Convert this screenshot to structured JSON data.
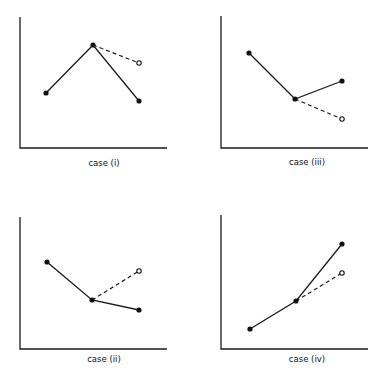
{
  "chart_data": [
    {
      "type": "line",
      "caption": "case (i)",
      "frame": {
        "x0": 20,
        "y0": 17,
        "x1": 167,
        "y1": 148
      },
      "solid_points": [
        [
          46,
          93
        ],
        [
          93,
          45
        ],
        [
          139,
          101
        ]
      ],
      "dashed": {
        "from": [
          93,
          45
        ],
        "to": [
          139,
          63
        ]
      },
      "open_point": [
        139,
        63
      ],
      "caption_pos": [
        104,
        158
      ],
      "description": "rise then fall; dashed extrapolation stays higher"
    },
    {
      "type": "line",
      "caption": "case (iii)",
      "frame": {
        "x0": 221,
        "y0": 16,
        "x1": 368,
        "y1": 148
      },
      "solid_points": [
        [
          249,
          53
        ],
        [
          295,
          99
        ],
        [
          342,
          81
        ]
      ],
      "dashed": {
        "from": [
          295,
          99
        ],
        "to": [
          342,
          119
        ]
      },
      "open_point": [
        342,
        119
      ],
      "caption_pos": [
        307,
        157
      ],
      "description": "fall then rise; dashed extrapolation continues falling"
    },
    {
      "type": "line",
      "caption": "case (ii)",
      "frame": {
        "x0": 20,
        "y0": 217,
        "x1": 167,
        "y1": 349
      },
      "solid_points": [
        [
          47,
          262
        ],
        [
          92,
          300
        ],
        [
          139,
          310
        ]
      ],
      "dashed": {
        "from": [
          92,
          300
        ],
        "to": [
          139,
          271
        ]
      },
      "open_point": [
        139,
        271
      ],
      "caption_pos": [
        104,
        354
      ],
      "description": "fall then slight fall; dashed extrapolation rises"
    },
    {
      "type": "line",
      "caption": "case (iv)",
      "frame": {
        "x0": 221,
        "y0": 215,
        "x1": 368,
        "y1": 349
      },
      "solid_points": [
        [
          250,
          329
        ],
        [
          296,
          301
        ],
        [
          342,
          244
        ]
      ],
      "dashed": {
        "from": [
          296,
          301
        ],
        "to": [
          342,
          273
        ]
      },
      "open_point": [
        342,
        273
      ],
      "caption_pos": [
        307,
        354
      ],
      "description": "rise then steeper rise; dashed extrapolation lower"
    }
  ],
  "colors": {
    "ink": "#1a1a1a",
    "background": "#ffffff"
  }
}
